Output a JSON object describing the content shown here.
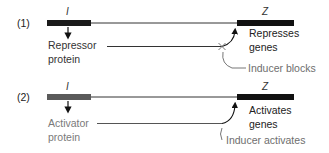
{
  "panels": [
    {
      "number": "(1)",
      "regulator_gene": "I",
      "target_gene": "Z",
      "protein_label_line1": "Repressor",
      "protein_label_line2": "protein",
      "effect_line1": "Represses",
      "effect_line2": "genes",
      "inducer_label": "Inducer blocks",
      "regulator_bar_color": "#1a1a1a",
      "protein_text_color": "#333333"
    },
    {
      "number": "(2)",
      "regulator_gene": "I",
      "target_gene": "Z",
      "protein_label_line1": "Activator",
      "protein_label_line2": "protein",
      "effect_line1": "Activates",
      "effect_line2": "genes",
      "inducer_label": "Inducer activates",
      "regulator_bar_color": "#5a5a5a",
      "protein_text_color": "#7a7a7a"
    }
  ],
  "colors": {
    "gene_bar": "#111111",
    "dna_line": "#333333",
    "inducer_text": "#6e6e6e"
  }
}
